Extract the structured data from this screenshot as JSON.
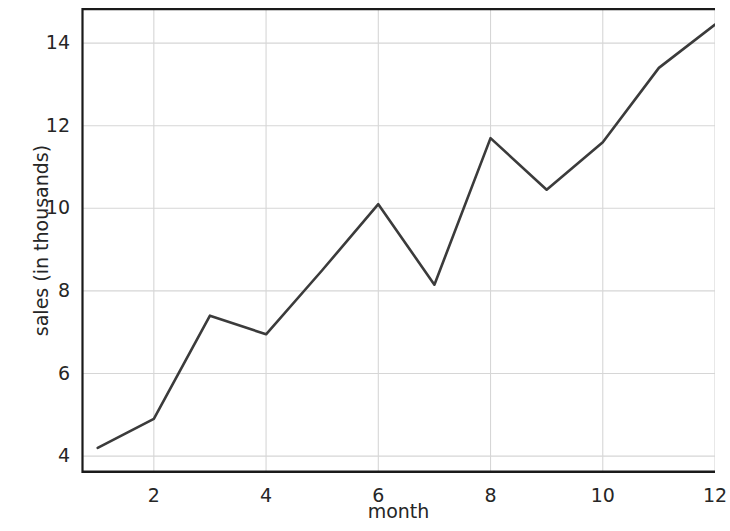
{
  "chart_data": {
    "type": "line",
    "title": "",
    "xlabel": "month",
    "ylabel": "sales (in thousands)",
    "x": [
      1,
      2,
      3,
      4,
      5,
      6,
      7,
      8,
      9,
      10,
      11,
      12
    ],
    "values": [
      4.2,
      4.9,
      7.4,
      6.95,
      8.5,
      10.1,
      8.15,
      11.7,
      10.45,
      11.6,
      13.4,
      14.45
    ],
    "series": [
      {
        "name": "sales",
        "values": [
          4.2,
          4.9,
          7.4,
          6.95,
          8.5,
          10.1,
          8.15,
          11.7,
          10.45,
          11.6,
          13.4,
          14.45
        ]
      }
    ],
    "xticks": [
      2,
      4,
      6,
      8,
      10,
      12
    ],
    "yticks": [
      4,
      6,
      8,
      10,
      12,
      14
    ],
    "xlim": [
      0.72,
      12.0
    ],
    "ylim": [
      3.62,
      14.85
    ],
    "grid": true,
    "legend": false,
    "line_color": "#3b3b3b",
    "grid_color": "#d6d6d6",
    "axis_color": "#1a1a1a",
    "background_color": "#ffffff",
    "marker": "none",
    "linewidth": 2.6
  },
  "axes": {
    "ylabel": "sales (in thousands)",
    "xlabel": "month",
    "ytick_labels": [
      "14",
      "12",
      "10",
      "8",
      "6",
      "4"
    ],
    "xtick_labels": [
      "2",
      "4",
      "6",
      "8",
      "10",
      "12"
    ]
  }
}
